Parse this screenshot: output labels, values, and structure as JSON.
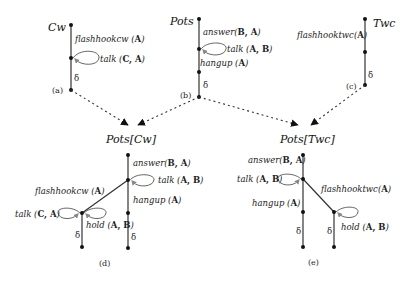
{
  "diagrams": {
    "a": {
      "title": "Cw",
      "caption": "(a)",
      "edges": [
        {
          "action": "flashhookcw",
          "args": "A"
        },
        {
          "action": "talk",
          "args": "C, A",
          "loop": true
        },
        {
          "action": "δ"
        }
      ]
    },
    "b": {
      "title": "Pots",
      "caption": "(b)",
      "edges": [
        {
          "action": "answer",
          "args": "B, A"
        },
        {
          "action": "talk",
          "args": "A, B",
          "loop": true
        },
        {
          "action": "hangup",
          "args": "A"
        },
        {
          "action": "δ"
        }
      ]
    },
    "c": {
      "title": "Twc",
      "caption": "(c)",
      "edges": [
        {
          "action": "flashhooktwc",
          "args": "A"
        },
        {
          "action": "δ"
        }
      ]
    },
    "d": {
      "title": "Pots[Cw]",
      "caption": "(d)",
      "edges": [
        {
          "action": "answer",
          "args": "B, A"
        },
        {
          "action": "talk",
          "args": "A, B",
          "loop": true
        },
        {
          "action": "hangup",
          "args": "A"
        },
        {
          "action": "flashhookcw",
          "args": "A"
        },
        {
          "action": "talk",
          "args": "C, A",
          "loop": true
        },
        {
          "action": "hold",
          "args": "A, B",
          "loop": true
        },
        {
          "action": "δ"
        },
        {
          "action": "δ"
        }
      ]
    },
    "e": {
      "title": "Pots[Twc]",
      "caption": "(e)",
      "edges": [
        {
          "action": "answer",
          "args": "B, A"
        },
        {
          "action": "talk",
          "args": "A, B",
          "loop": true
        },
        {
          "action": "hangup",
          "args": "A"
        },
        {
          "action": "flashhooktwc",
          "args": "A"
        },
        {
          "action": "hold",
          "args": "A, B",
          "loop": true
        },
        {
          "action": "δ"
        },
        {
          "action": "δ"
        }
      ]
    }
  },
  "labels": {
    "flashhookcw": "flashhookcw",
    "flashhooktwc": "flashhooktwc",
    "talk": "talk",
    "answer": "answer",
    "hangup": "hangup",
    "hold": "hold",
    "delta": "δ",
    "A": "A",
    "CA": "C, A",
    "AB": "A, B",
    "BA": "B, A",
    "open": " (",
    "close": ")",
    "openTight": "("
  }
}
